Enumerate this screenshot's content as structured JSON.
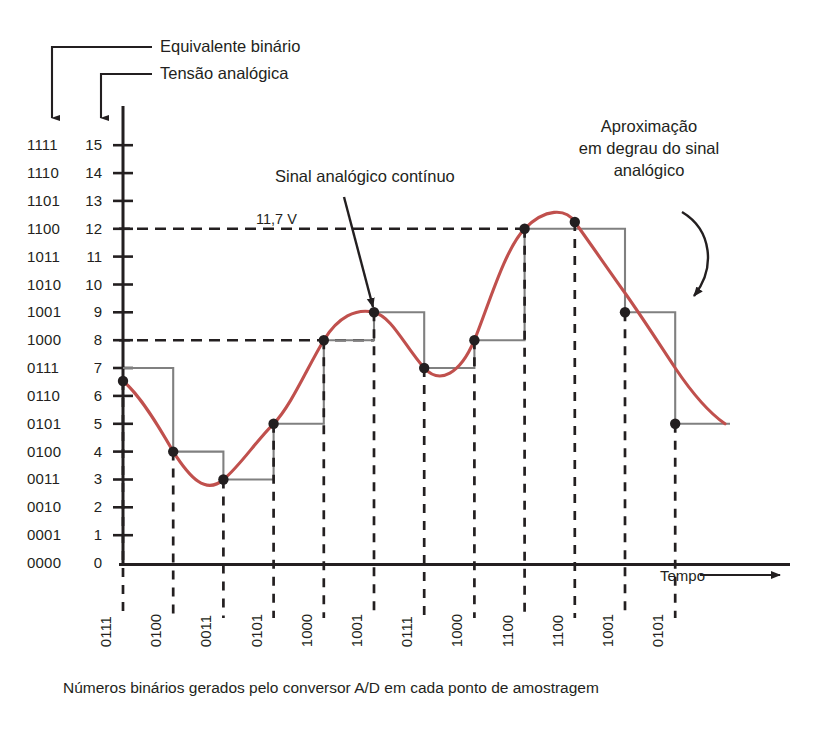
{
  "figure": {
    "title_leaders": [
      {
        "label": "Equivalente binário"
      },
      {
        "label": "Tensão analógica"
      }
    ],
    "annotations": [
      {
        "name": "analog-signal",
        "label": "Sinal analógico contínuo"
      },
      {
        "name": "step-approx",
        "line1": "Aproximação",
        "line2": "em degrau do sinal",
        "line3": "analógico"
      }
    ],
    "voltage_marker": "11,7 V",
    "time_axis_label": "Tempo",
    "caption": "Números binários gerados pelo conversor A/D em cada ponto de amostragem"
  },
  "chart_data": {
    "type": "line",
    "title": "",
    "xlabel": "Tempo",
    "ylabel": "",
    "ylim": [
      0,
      15
    ],
    "grid": false,
    "legend_position": "none",
    "y_axis": {
      "decimal_ticks": [
        15,
        14,
        13,
        12,
        11,
        10,
        9,
        8,
        7,
        6,
        5,
        4,
        3,
        2,
        1,
        0
      ],
      "binary_ticks": [
        "1111",
        "1110",
        "1101",
        "1100",
        "1011",
        "1010",
        "1001",
        "1000",
        "0111",
        "0110",
        "0101",
        "0100",
        "0011",
        "0010",
        "0001",
        "0000"
      ]
    },
    "sample_points": [
      {
        "index": 1,
        "binary": "0111",
        "value": 7
      },
      {
        "index": 2,
        "binary": "0100",
        "value": 4
      },
      {
        "index": 3,
        "binary": "0011",
        "value": 3
      },
      {
        "index": 4,
        "binary": "0101",
        "value": 5
      },
      {
        "index": 5,
        "binary": "1000",
        "value": 8
      },
      {
        "index": 6,
        "binary": "1001",
        "value": 9
      },
      {
        "index": 7,
        "binary": "0111",
        "value": 7
      },
      {
        "index": 8,
        "binary": "1000",
        "value": 8
      },
      {
        "index": 9,
        "binary": "1100",
        "value": 12
      },
      {
        "index": 10,
        "binary": "1100",
        "value": 12
      },
      {
        "index": 11,
        "binary": "1001",
        "value": 9
      },
      {
        "index": 12,
        "binary": "0101",
        "value": 5
      }
    ],
    "reference_lines": [
      {
        "name": "11,7 V level",
        "value": 12,
        "label": "11,7 V"
      },
      {
        "name": "8 level",
        "value": 8,
        "label": ""
      }
    ],
    "colors": {
      "analog_curve": "#c0504d",
      "staircase": "#808080",
      "axis": "#231f20",
      "text": "#231f20"
    }
  }
}
